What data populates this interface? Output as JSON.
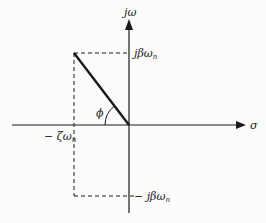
{
  "diagram": {
    "type": "s-plane pole location",
    "axes": {
      "vertical_label": "jω",
      "horizontal_label": "σ"
    },
    "labels": {
      "imag_pos": "jβω",
      "imag_pos_sub": "n",
      "imag_neg": "− jβω",
      "imag_neg_sub": "n",
      "real_neg": "− ζω",
      "real_neg_sub": "n",
      "angle": "ϕ"
    },
    "colors": {
      "line": "#1a1a1a",
      "background": "#fbfbfa"
    }
  }
}
